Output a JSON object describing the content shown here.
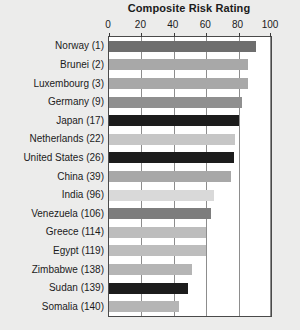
{
  "chart_data": {
    "type": "bar",
    "orientation": "horizontal",
    "title": "Composite Risk Rating",
    "xlabel": "",
    "ylabel": "",
    "xlim": [
      0,
      100
    ],
    "xticks": [
      0,
      20,
      40,
      60,
      80,
      100
    ],
    "xtick_labels": [
      "0",
      "20",
      "40",
      "60",
      "80",
      "100"
    ],
    "grid": true,
    "legend": "none",
    "categories": [
      "Norway (1)",
      "Brunei (2)",
      "Luxembourg (3)",
      "Germany (9)",
      "Japan (17)",
      "Netherlands (22)",
      "United States (26)",
      "China (39)",
      "India (96)",
      "Venezuela (106)",
      "Greece (114)",
      "Egypt (119)",
      "Zimbabwe (138)",
      "Sudan (139)",
      "Somalia (140)"
    ],
    "values": [
      91,
      86,
      86,
      82,
      80,
      78,
      77,
      75,
      65,
      63,
      60,
      60,
      51,
      49,
      43
    ],
    "bar_colors": [
      "#6e6e6e",
      "#a8a8a8",
      "#a8a8a8",
      "#8f8f8f",
      "#1c1c1c",
      "#c6c6c6",
      "#1c1c1c",
      "#a8a8a8",
      "#d9d9d9",
      "#7d7d7d",
      "#bdbdbd",
      "#bdbdbd",
      "#b5b5b5",
      "#1c1c1c",
      "#b5b5b5"
    ]
  },
  "colors": {
    "figure_background": "#ececeb",
    "plot_background": "#ffffff",
    "axis_line": "#4a4a4a",
    "gridline": "#8d8d8d",
    "text": "#1b1b1b"
  }
}
